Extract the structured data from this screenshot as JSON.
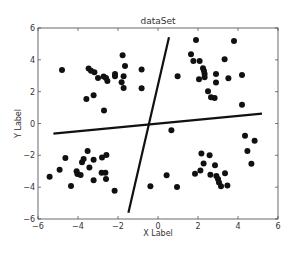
{
  "chart_data": {
    "type": "scatter",
    "title": "dataSet",
    "xlabel": "X Label",
    "ylabel": "Y Label",
    "xlim": [
      -6,
      6
    ],
    "ylim": [
      -6,
      6
    ],
    "xticks": [
      -6,
      -4,
      -2,
      0,
      2,
      4,
      6
    ],
    "yticks": [
      -6,
      -4,
      -2,
      0,
      2,
      4,
      6
    ],
    "xtick_labels": [
      "−6",
      "−4",
      "−2",
      "0",
      "2",
      "4",
      "6"
    ],
    "ytick_labels": [
      "−6",
      "−4",
      "−2",
      "0",
      "2",
      "4",
      "6"
    ],
    "grid": false,
    "legend": null,
    "marker_color": "#111111",
    "line_color": "#111111",
    "series": [
      {
        "name": "points",
        "kind": "scatter",
        "points": [
          [
            -4.8,
            3.36
          ],
          [
            -3.47,
            3.45
          ],
          [
            -3.35,
            3.32
          ],
          [
            -3.18,
            3.22
          ],
          [
            -3.0,
            2.86
          ],
          [
            -2.72,
            2.95
          ],
          [
            -2.6,
            2.86
          ],
          [
            -2.53,
            2.67
          ],
          [
            -2.15,
            3.11
          ],
          [
            -2.15,
            2.97
          ],
          [
            -1.77,
            4.29
          ],
          [
            -1.65,
            3.62
          ],
          [
            -1.72,
            2.97
          ],
          [
            -1.82,
            2.59
          ],
          [
            -1.72,
            2.23
          ],
          [
            -0.82,
            3.39
          ],
          [
            -0.82,
            2.21
          ],
          [
            -3.58,
            1.54
          ],
          [
            -3.22,
            1.77
          ],
          [
            -2.7,
            0.81
          ],
          [
            1.9,
            5.25
          ],
          [
            3.8,
            5.19
          ],
          [
            1.65,
            4.35
          ],
          [
            1.77,
            3.93
          ],
          [
            2.08,
            3.93
          ],
          [
            3.33,
            4.04
          ],
          [
            2.25,
            3.47
          ],
          [
            2.3,
            3.3
          ],
          [
            2.33,
            3.11
          ],
          [
            2.33,
            2.91
          ],
          [
            2.05,
            2.78
          ],
          [
            0.98,
            2.97
          ],
          [
            2.9,
            3.11
          ],
          [
            2.9,
            2.57
          ],
          [
            3.52,
            2.84
          ],
          [
            4.2,
            3.05
          ],
          [
            2.5,
            2.03
          ],
          [
            2.65,
            1.65
          ],
          [
            2.83,
            1.6
          ],
          [
            4.2,
            1.18
          ],
          [
            -5.42,
            -3.34
          ],
          [
            -4.92,
            -2.9
          ],
          [
            -4.63,
            -2.17
          ],
          [
            -4.35,
            -3.93
          ],
          [
            -4.07,
            -3.0
          ],
          [
            -4.03,
            -3.18
          ],
          [
            -3.87,
            -3.24
          ],
          [
            -3.8,
            -2.44
          ],
          [
            -3.72,
            -2.23
          ],
          [
            -3.52,
            -1.73
          ],
          [
            -3.43,
            -2.76
          ],
          [
            -3.22,
            -2.28
          ],
          [
            -3.22,
            -3.57
          ],
          [
            -2.8,
            -2.13
          ],
          [
            -2.58,
            -1.98
          ],
          [
            -2.82,
            -3.09
          ],
          [
            -2.63,
            -3.09
          ],
          [
            -2.6,
            -3.49
          ],
          [
            -2.17,
            -4.23
          ],
          [
            -0.38,
            -3.95
          ],
          [
            0.67,
            -0.43
          ],
          [
            4.35,
            -0.77
          ],
          [
            4.83,
            -1.08
          ],
          [
            4.47,
            -1.73
          ],
          [
            4.67,
            -2.53
          ],
          [
            2.17,
            -1.88
          ],
          [
            2.58,
            -2.0
          ],
          [
            2.28,
            -2.51
          ],
          [
            2.85,
            -2.63
          ],
          [
            2.12,
            -2.95
          ],
          [
            1.85,
            -3.16
          ],
          [
            2.62,
            -3.22
          ],
          [
            3.35,
            -3.13
          ],
          [
            2.92,
            -3.3
          ],
          [
            3.0,
            -3.49
          ],
          [
            3.05,
            -3.7
          ],
          [
            3.15,
            -3.95
          ],
          [
            3.47,
            -3.89
          ],
          [
            0.43,
            -3.25
          ],
          [
            0.95,
            -3.99
          ]
        ]
      },
      {
        "name": "line-steep",
        "kind": "line",
        "points": [
          [
            -1.48,
            -5.6
          ],
          [
            0.55,
            5.42
          ]
        ]
      },
      {
        "name": "line-flat",
        "kind": "line",
        "points": [
          [
            -5.23,
            -0.64
          ],
          [
            5.2,
            0.62
          ]
        ]
      }
    ]
  }
}
